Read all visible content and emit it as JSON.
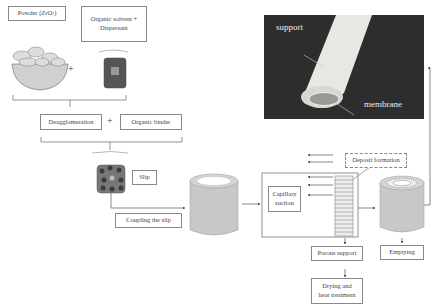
{
  "ingredients": {
    "powder_label": "Powder (ZrO",
    "powder_subscript": "2",
    "powder_close": ")",
    "solvent_label_line1": "Organic solvent +",
    "solvent_label_line2": "Dispersant",
    "plus": "+"
  },
  "step2": {
    "deagglomeration": "Deagglomeration",
    "plus": "+",
    "binder": "Organic binder"
  },
  "slip": {
    "label": "Slip",
    "coupling": "Coupling the slip"
  },
  "process": {
    "capillary_line1": "Capillary",
    "capillary_line2": "suction",
    "deposit": "Deposit formation",
    "porous_support": "Porous support",
    "drying_line1": "Drying and",
    "drying_line2": "heat treatment",
    "emptying": "Emptying"
  },
  "photo": {
    "support_label": "support",
    "membrane_label": "membrane"
  },
  "colors": {
    "cylinder": "#c8c8c8",
    "photo_bg": "#2d2d2d",
    "slip_dark": "#4a4a4a",
    "slip_fill": "#7a7a7a"
  }
}
